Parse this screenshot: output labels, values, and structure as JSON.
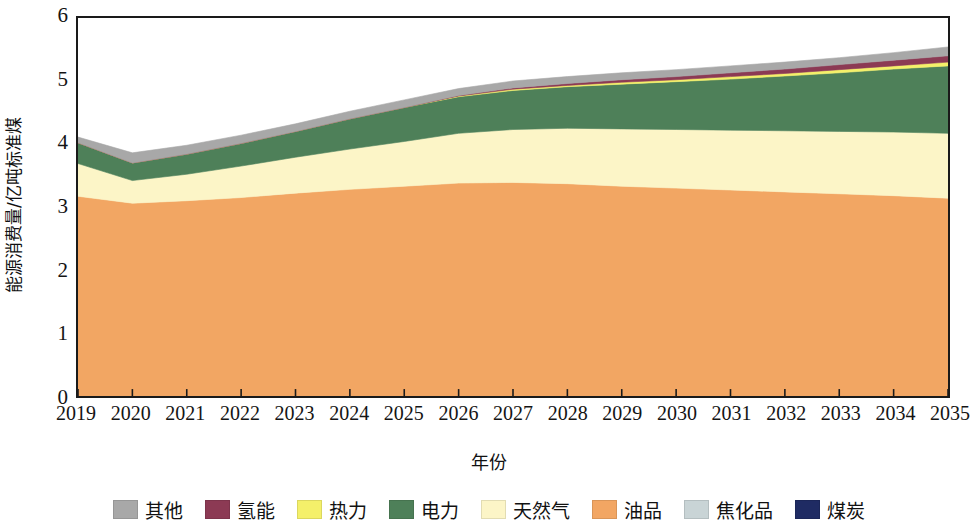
{
  "chart_data": {
    "type": "area",
    "stacked": true,
    "title": "",
    "xlabel": "年份",
    "ylabel": "能源消费量/亿吨标准煤",
    "xlim": [
      2019,
      2035
    ],
    "ylim": [
      0,
      6
    ],
    "yticks": [
      0,
      1,
      2,
      3,
      4,
      5,
      6
    ],
    "grid": false,
    "legend_position": "bottom",
    "x": [
      2019,
      2020,
      2021,
      2022,
      2023,
      2024,
      2025,
      2026,
      2027,
      2028,
      2029,
      2030,
      2031,
      2032,
      2033,
      2034,
      2035
    ],
    "categories": [
      "2019",
      "2020",
      "2021",
      "2022",
      "2023",
      "2024",
      "2025",
      "2026",
      "2027",
      "2028",
      "2029",
      "2030",
      "2031",
      "2032",
      "2033",
      "2034",
      "2035"
    ],
    "stack_order_bottom_to_top": [
      "煤炭",
      "焦化品",
      "油品",
      "天然气",
      "电力",
      "热力",
      "氢能",
      "其他"
    ],
    "series": [
      {
        "name": "煤炭",
        "color": "#1F2B63",
        "values": [
          0,
          0,
          0,
          0,
          0,
          0,
          0,
          0,
          0,
          0,
          0,
          0,
          0,
          0,
          0,
          0,
          0
        ]
      },
      {
        "name": "焦化品",
        "color": "#C9D4D6",
        "values": [
          0,
          0,
          0,
          0,
          0,
          0,
          0,
          0,
          0,
          0,
          0,
          0,
          0,
          0,
          0,
          0,
          0
        ]
      },
      {
        "name": "油品",
        "color": "#F2A663",
        "values": [
          3.17,
          3.06,
          3.1,
          3.15,
          3.22,
          3.28,
          3.33,
          3.38,
          3.39,
          3.37,
          3.33,
          3.3,
          3.27,
          3.24,
          3.21,
          3.18,
          3.14
        ]
      },
      {
        "name": "天然气",
        "color": "#FCF5C7",
        "values": [
          0.52,
          0.36,
          0.42,
          0.5,
          0.57,
          0.64,
          0.71,
          0.79,
          0.84,
          0.88,
          0.91,
          0.93,
          0.95,
          0.97,
          0.99,
          1.01,
          1.03
        ]
      },
      {
        "name": "电力",
        "color": "#4E8059",
        "values": [
          0.33,
          0.28,
          0.32,
          0.36,
          0.41,
          0.48,
          0.54,
          0.58,
          0.62,
          0.66,
          0.71,
          0.76,
          0.81,
          0.87,
          0.93,
          1.0,
          1.07
        ]
      },
      {
        "name": "热力",
        "color": "#F4F06A",
        "values": [
          0.0,
          0.0,
          0.0,
          0.0,
          0.0,
          0.0,
          0.0,
          0.01,
          0.02,
          0.02,
          0.03,
          0.03,
          0.04,
          0.04,
          0.05,
          0.05,
          0.06
        ]
      },
      {
        "name": "氢能",
        "color": "#8C3A54",
        "values": [
          0.0,
          0.0,
          0.0,
          0.0,
          0.0,
          0.0,
          0.0,
          0.01,
          0.02,
          0.03,
          0.04,
          0.05,
          0.06,
          0.07,
          0.08,
          0.09,
          0.1
        ]
      },
      {
        "name": "其他",
        "color": "#A8A8A8",
        "values": [
          0.09,
          0.16,
          0.14,
          0.13,
          0.12,
          0.12,
          0.12,
          0.11,
          0.11,
          0.11,
          0.11,
          0.11,
          0.11,
          0.11,
          0.11,
          0.12,
          0.14
        ]
      }
    ],
    "cumulative_tops": {
      "油品": [
        3.17,
        3.06,
        3.1,
        3.15,
        3.22,
        3.28,
        3.33,
        3.38,
        3.39,
        3.37,
        3.33,
        3.3,
        3.27,
        3.24,
        3.21,
        3.18,
        3.14
      ],
      "天然气": [
        3.69,
        3.42,
        3.52,
        3.65,
        3.79,
        3.92,
        4.04,
        4.17,
        4.23,
        4.25,
        4.24,
        4.23,
        4.22,
        4.21,
        4.2,
        4.19,
        4.17
      ],
      "电力": [
        4.02,
        3.7,
        3.84,
        4.01,
        4.2,
        4.4,
        4.58,
        4.75,
        4.85,
        4.91,
        4.95,
        4.99,
        5.03,
        5.08,
        5.13,
        5.19,
        5.24
      ],
      "热力": [
        4.02,
        3.7,
        3.84,
        4.01,
        4.2,
        4.4,
        4.58,
        4.76,
        4.87,
        4.93,
        4.98,
        5.02,
        5.07,
        5.12,
        5.18,
        5.24,
        5.3
      ],
      "氢能": [
        4.02,
        3.7,
        3.84,
        4.01,
        4.2,
        4.4,
        4.58,
        4.77,
        4.89,
        4.96,
        5.02,
        5.07,
        5.13,
        5.19,
        5.26,
        5.33,
        5.4
      ],
      "其他": [
        4.11,
        3.86,
        3.98,
        4.14,
        4.32,
        4.52,
        4.7,
        4.88,
        5.0,
        5.07,
        5.13,
        5.18,
        5.24,
        5.3,
        5.37,
        5.45,
        5.54
      ]
    }
  },
  "axes": {
    "ylabel": "能源消费量/亿吨标准煤",
    "xlabel": "年份",
    "ytick_labels": [
      "6",
      "5",
      "4",
      "3",
      "2",
      "1",
      "0"
    ],
    "xtick_labels": [
      "2019",
      "2020",
      "2021",
      "2022",
      "2023",
      "2024",
      "2025",
      "2026",
      "2027",
      "2028",
      "2029",
      "2030",
      "2031",
      "2032",
      "2033",
      "2034",
      "2035"
    ]
  },
  "legend": {
    "items": [
      {
        "label": "其他",
        "color": "#A8A8A8"
      },
      {
        "label": "氢能",
        "color": "#8C3A54"
      },
      {
        "label": "热力",
        "color": "#F4F06A"
      },
      {
        "label": "电力",
        "color": "#4E8059"
      },
      {
        "label": "天然气",
        "color": "#FCF5C7"
      },
      {
        "label": "油品",
        "color": "#F2A663"
      },
      {
        "label": "焦化品",
        "color": "#C9D4D6"
      },
      {
        "label": "煤炭",
        "color": "#1F2B63"
      }
    ]
  }
}
